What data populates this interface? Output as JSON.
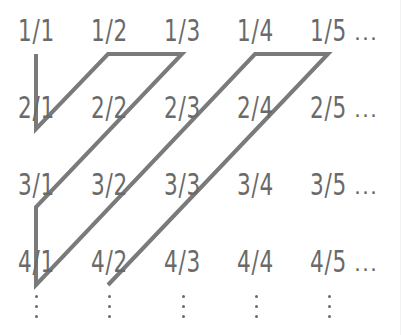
{
  "grid": {
    "rows": [
      [
        "1/1",
        "1/2",
        "1/3",
        "1/4",
        "1/5"
      ],
      [
        "2/1",
        "2/2",
        "2/3",
        "2/4",
        "2/5"
      ],
      [
        "3/1",
        "3/2",
        "3/3",
        "3/4",
        "3/5"
      ],
      [
        "4/1",
        "4/2",
        "4/3",
        "4/4",
        "4/5"
      ]
    ],
    "row_continuation": "...",
    "column_continuation": "⋮"
  },
  "path": {
    "color": "#7a7a7a",
    "stroke_width": 4,
    "points": [
      [
        36,
        54
      ],
      [
        36,
        129
      ],
      [
        108,
        54
      ],
      [
        182,
        54
      ],
      [
        36,
        207
      ],
      [
        36,
        285
      ],
      [
        255,
        54
      ],
      [
        328,
        54
      ],
      [
        108,
        285
      ]
    ]
  }
}
